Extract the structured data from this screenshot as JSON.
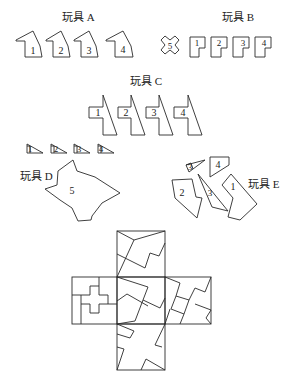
{
  "toys": {
    "a": {
      "label": "玩具 A",
      "pieces": [
        "1",
        "2",
        "3",
        "4"
      ]
    },
    "b": {
      "label": "玩具 B",
      "pieces": [
        "5",
        "1",
        "2",
        "3",
        "4"
      ]
    },
    "c": {
      "label": "玩具 C",
      "pieces": [
        "1",
        "2",
        "3",
        "4"
      ],
      "small_pieces": [
        "1",
        "2",
        "3",
        "4"
      ]
    },
    "d": {
      "label": "玩具 D",
      "pieces": [
        "5"
      ]
    },
    "e": {
      "label": "玩具 E",
      "pieces": [
        "3",
        "4",
        "2",
        "3",
        "1"
      ]
    }
  },
  "cube_net": {
    "description": "unfolded cube net with assembled puzzle pieces"
  }
}
